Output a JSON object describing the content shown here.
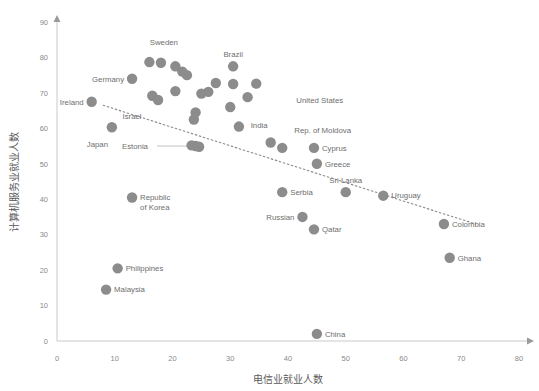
{
  "chart_data": {
    "type": "scatter",
    "title": "",
    "xlabel": "电信业就业人数",
    "ylabel": "计算机服务业就业人数",
    "xlim": [
      0,
      80
    ],
    "ylim": [
      0,
      90
    ],
    "xticks": [
      0,
      10,
      20,
      30,
      40,
      50,
      60,
      70,
      80
    ],
    "yticks": [
      0,
      10,
      20,
      30,
      40,
      50,
      60,
      70,
      80,
      90
    ],
    "grid": false,
    "legend": "none",
    "marker_color": "#8c8c8c",
    "trendline": {
      "style": "dotted",
      "color": "#8a8a8a",
      "x0": 8.0,
      "y0": 66.5,
      "x1": 72.5,
      "y1": 33.0
    },
    "points": [
      {
        "name": "Sweden",
        "x": 18.0,
        "y": 78.5,
        "label": "Sweden",
        "label_pos": "above-left",
        "lx": 18.5,
        "ly": 83.5,
        "anchor": "mid"
      },
      {
        "name": "Germany",
        "x": 13.0,
        "y": 74.0,
        "label": "Germany",
        "label_pos": "left",
        "lx": 6.5,
        "ly": 77.0,
        "anchor": "mid"
      },
      {
        "name": "Ireland",
        "x": 6.0,
        "y": 67.5,
        "label": "Ireland",
        "label_pos": "left",
        "lx": 6.0,
        "ly": 67.5,
        "anchor": "mid"
      },
      {
        "name": "Israel",
        "x": 13.0,
        "y": 63.5,
        "label": "Israel",
        "label_pos": "label-only",
        "lx": 13.0,
        "ly": 63.5,
        "anchor": "mid"
      },
      {
        "name": "Japan",
        "x": 9.5,
        "y": 60.3,
        "label": "Japan",
        "label_pos": "below-left",
        "lx": 7.0,
        "ly": 55.5,
        "anchor": "mid"
      },
      {
        "name": "Brazil",
        "x": 30.5,
        "y": 77.5,
        "label": "Brazil",
        "label_pos": "above",
        "lx": 30.5,
        "ly": 77.5,
        "anchor": "mid"
      },
      {
        "name": "United States",
        "x": 45.5,
        "y": 68.0,
        "label": "United States",
        "label_pos": "label-only",
        "lx": 45.5,
        "ly": 68.0,
        "anchor": "mid"
      },
      {
        "name": "India",
        "x": 35.0,
        "y": 61.0,
        "label": "India",
        "label_pos": "label-only",
        "lx": 35.0,
        "ly": 61.0,
        "anchor": "mid"
      },
      {
        "name": "Estonia",
        "x": 24.0,
        "y": 55.0,
        "label": "Estonia",
        "label_pos": "leader-left",
        "lx": 13.5,
        "ly": 55.0,
        "anchor": "mid"
      },
      {
        "name": "Rep. of Moldova",
        "x": 46.0,
        "y": 59.5,
        "label": "Rep. of Moldova",
        "label_pos": "label-only",
        "lx": 46.0,
        "ly": 59.5,
        "anchor": "mid"
      },
      {
        "name": "Cyprus",
        "x": 44.5,
        "y": 54.5,
        "label": "Cyprus",
        "label_pos": "right",
        "lx": 44.5,
        "ly": 54.5,
        "anchor": "start"
      },
      {
        "name": "Greece",
        "x": 45.0,
        "y": 50.0,
        "label": "Greece",
        "label_pos": "right",
        "lx": 45.0,
        "ly": 50.0,
        "anchor": "start"
      },
      {
        "name": "Sri Lanka",
        "x": 50.0,
        "y": 42.0,
        "label": "Sri Lanka",
        "label_pos": "above",
        "lx": 50.0,
        "ly": 42.0,
        "anchor": "mid"
      },
      {
        "name": "Uruguay",
        "x": 56.5,
        "y": 41.0,
        "label": "Uruguay",
        "label_pos": "right",
        "lx": 56.5,
        "ly": 41.0,
        "anchor": "start"
      },
      {
        "name": "Serbia",
        "x": 39.0,
        "y": 42.0,
        "label": "Serbia",
        "label_pos": "right",
        "lx": 39.0,
        "ly": 42.0,
        "anchor": "start"
      },
      {
        "name": "Russian",
        "x": 42.5,
        "y": 35.0,
        "label": "Russian",
        "label_pos": "left",
        "lx": 42.5,
        "ly": 35.0,
        "anchor": "end"
      },
      {
        "name": "Qatar",
        "x": 44.5,
        "y": 31.5,
        "label": "Qatar",
        "label_pos": "right",
        "lx": 44.5,
        "ly": 31.5,
        "anchor": "start"
      },
      {
        "name": "Colombia",
        "x": 67.0,
        "y": 33.0,
        "label": "Colombia",
        "label_pos": "right",
        "lx": 67.0,
        "ly": 33.0,
        "anchor": "start"
      },
      {
        "name": "Ghana",
        "x": 68.0,
        "y": 23.5,
        "label": "Ghana",
        "label_pos": "right",
        "lx": 68.0,
        "ly": 23.5,
        "anchor": "start"
      },
      {
        "name": "Republic of Korea",
        "x": 13.0,
        "y": 40.5,
        "label": "Republic\nof Korea",
        "label_pos": "right",
        "lx": 13.0,
        "ly": 40.5,
        "anchor": "start"
      },
      {
        "name": "Philippines",
        "x": 10.5,
        "y": 20.5,
        "label": "Philippines",
        "label_pos": "right",
        "lx": 10.5,
        "ly": 20.5,
        "anchor": "start"
      },
      {
        "name": "Malaysia",
        "x": 8.5,
        "y": 14.5,
        "label": "Malaysia",
        "label_pos": "right",
        "lx": 8.5,
        "ly": 14.5,
        "anchor": "start"
      },
      {
        "name": "China",
        "x": 45.0,
        "y": 2.0,
        "label": "China",
        "label_pos": "right",
        "lx": 45.0,
        "ly": 2.0,
        "anchor": "start"
      },
      {
        "name": "unlabeled-1",
        "x": 16.0,
        "y": 78.7,
        "label": "",
        "label_pos": "none"
      },
      {
        "name": "unlabeled-2",
        "x": 20.5,
        "y": 77.5,
        "label": "",
        "label_pos": "none"
      },
      {
        "name": "unlabeled-3",
        "x": 21.7,
        "y": 76.0,
        "label": "",
        "label_pos": "none"
      },
      {
        "name": "unlabeled-4",
        "x": 22.5,
        "y": 75.0,
        "label": "",
        "label_pos": "none"
      },
      {
        "name": "unlabeled-5",
        "x": 27.5,
        "y": 72.8,
        "label": "",
        "label_pos": "none"
      },
      {
        "name": "unlabeled-6",
        "x": 30.5,
        "y": 72.5,
        "label": "",
        "label_pos": "none"
      },
      {
        "name": "unlabeled-7",
        "x": 34.5,
        "y": 72.6,
        "label": "",
        "label_pos": "none"
      },
      {
        "name": "unlabeled-8",
        "x": 16.5,
        "y": 69.2,
        "label": "",
        "label_pos": "none"
      },
      {
        "name": "unlabeled-9",
        "x": 17.5,
        "y": 68.0,
        "label": "",
        "label_pos": "none"
      },
      {
        "name": "unlabeled-10",
        "x": 20.5,
        "y": 70.5,
        "label": "",
        "label_pos": "none"
      },
      {
        "name": "unlabeled-11",
        "x": 25.0,
        "y": 69.8,
        "label": "",
        "label_pos": "none"
      },
      {
        "name": "unlabeled-12",
        "x": 26.2,
        "y": 70.3,
        "label": "",
        "label_pos": "none"
      },
      {
        "name": "unlabeled-13",
        "x": 33.0,
        "y": 68.8,
        "label": "",
        "label_pos": "none"
      },
      {
        "name": "unlabeled-14",
        "x": 30.0,
        "y": 66.0,
        "label": "",
        "label_pos": "none"
      },
      {
        "name": "unlabeled-15",
        "x": 24.0,
        "y": 64.5,
        "label": "",
        "label_pos": "none"
      },
      {
        "name": "unlabeled-16",
        "x": 23.7,
        "y": 62.5,
        "label": "",
        "label_pos": "none"
      },
      {
        "name": "unlabeled-17",
        "x": 31.5,
        "y": 60.5,
        "label": "",
        "label_pos": "none"
      },
      {
        "name": "unlabeled-18",
        "x": 37.0,
        "y": 56.0,
        "label": "",
        "label_pos": "none"
      },
      {
        "name": "unlabeled-19",
        "x": 39.0,
        "y": 54.5,
        "label": "",
        "label_pos": "none"
      },
      {
        "name": "unlabeled-20",
        "x": 23.3,
        "y": 55.2,
        "label": "",
        "label_pos": "none"
      },
      {
        "name": "unlabeled-21",
        "x": 24.6,
        "y": 54.8,
        "label": "",
        "label_pos": "none"
      }
    ]
  },
  "axes": {
    "x_tick_labels": [
      "0",
      "10",
      "20",
      "30",
      "40",
      "50",
      "60",
      "70",
      "80"
    ],
    "y_tick_labels": [
      "0",
      "10",
      "20",
      "30",
      "40",
      "50",
      "60",
      "70",
      "80",
      "90"
    ],
    "x_title": "电信业就业人数",
    "y_title": "计算机服务业就业人数"
  }
}
